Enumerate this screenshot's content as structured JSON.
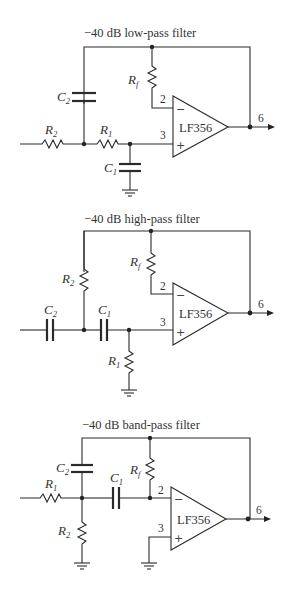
{
  "circuits": [
    {
      "title": "−40 dB low-pass filter",
      "opamp": "LF356",
      "pins": {
        "inv": "2",
        "noninv": "3",
        "out": "6"
      },
      "signs": {
        "inv": "−",
        "noninv": "+"
      },
      "components": {
        "rf": {
          "main": "R",
          "sub": "f"
        },
        "c2": {
          "main": "C",
          "sub": "2"
        },
        "r2": {
          "main": "R",
          "sub": "2"
        },
        "r1": {
          "main": "R",
          "sub": "1"
        },
        "c1": {
          "main": "C",
          "sub": "1"
        }
      }
    },
    {
      "title": "−40 dB high-pass filter",
      "opamp": "LF356",
      "pins": {
        "inv": "2",
        "noninv": "3",
        "out": "6"
      },
      "signs": {
        "inv": "−",
        "noninv": "+"
      },
      "components": {
        "rf": {
          "main": "R",
          "sub": "f"
        },
        "r2": {
          "main": "R",
          "sub": "2"
        },
        "c2": {
          "main": "C",
          "sub": "2"
        },
        "c1": {
          "main": "C",
          "sub": "1"
        },
        "r1": {
          "main": "R",
          "sub": "1"
        }
      }
    },
    {
      "title": "−40 dB band-pass filter",
      "opamp": "LF356",
      "pins": {
        "inv": "2",
        "noninv": "3",
        "out": "6"
      },
      "signs": {
        "inv": "−",
        "noninv": "+"
      },
      "components": {
        "c2": {
          "main": "C",
          "sub": "2"
        },
        "rf": {
          "main": "R",
          "sub": "f"
        },
        "r1": {
          "main": "R",
          "sub": "1"
        },
        "c1": {
          "main": "C",
          "sub": "1"
        },
        "r2": {
          "main": "R",
          "sub": "2"
        }
      }
    }
  ]
}
